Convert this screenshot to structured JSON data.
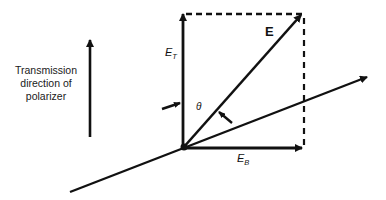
{
  "diagram": {
    "caption": [
      "Transmission",
      "direction of",
      "polarizer"
    ],
    "labels": {
      "field_vector": "E",
      "transmitted_component": "E",
      "transmitted_subscript": "T",
      "blocked_component": "E",
      "blocked_subscript": "B",
      "angle": "θ"
    },
    "elements": [
      "transmission-direction-arrow",
      "transmitted-component-vector",
      "blocked-component-vector",
      "electric-field-vector",
      "propagation-axis-line",
      "dashed-projection-lines",
      "angle-indicator-arrows"
    ],
    "colors": {
      "ink": "#111111",
      "background": "#ffffff"
    }
  }
}
